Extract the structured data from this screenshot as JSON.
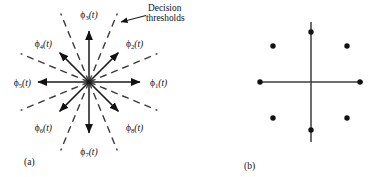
{
  "figure": {
    "panels": [
      {
        "id": "a",
        "caption": "(a)",
        "caption_x": 28,
        "caption_y": 162,
        "type": "signal-space-diagram",
        "center": {
          "x": 89,
          "y": 82
        },
        "annotation": {
          "line1": "Decision",
          "line2": "thresholds",
          "x": 128,
          "y": 12
        },
        "basis_functions": [
          {
            "name": "phi-1",
            "symbol": "ϕ",
            "subscript": "1",
            "arg": "(t)",
            "angle_deg": 0,
            "label_x": 150,
            "label_y": 85,
            "anchor": "start"
          },
          {
            "name": "phi-2",
            "symbol": "ϕ",
            "subscript": "2",
            "arg": "(t)",
            "angle_deg": 45,
            "label_x": 133,
            "label_y": 46,
            "anchor": "start"
          },
          {
            "name": "phi-3",
            "symbol": "ϕ",
            "subscript": "3",
            "arg": "(t)",
            "angle_deg": 90,
            "label_x": 89,
            "label_y": 16,
            "anchor": "middle"
          },
          {
            "name": "phi-4",
            "symbol": "ϕ",
            "subscript": "4",
            "arg": "(t)",
            "angle_deg": 135,
            "label_x": 45,
            "label_y": 46,
            "anchor": "end"
          },
          {
            "name": "phi-5",
            "symbol": "ϕ",
            "subscript": "5",
            "arg": "(t)",
            "angle_deg": 180,
            "label_x": 28,
            "label_y": 85,
            "anchor": "end"
          },
          {
            "name": "phi-6",
            "symbol": "ϕ",
            "subscript": "6",
            "arg": "(t)",
            "angle_deg": 225,
            "label_x": 45,
            "label_y": 130,
            "anchor": "end"
          },
          {
            "name": "phi-7",
            "symbol": "ϕ",
            "subscript": "7",
            "arg": "(t)",
            "angle_deg": 270,
            "label_x": 89,
            "label_y": 154,
            "anchor": "middle"
          },
          {
            "name": "phi-8",
            "symbol": "ϕ",
            "subscript": "8",
            "arg": "(t)",
            "angle_deg": 315,
            "label_x": 133,
            "label_y": 130,
            "anchor": "start"
          }
        ],
        "threshold_angles_deg": [
          22.5,
          67.5,
          112.5,
          157.5,
          202.5,
          247.5,
          292.5,
          337.5
        ],
        "axis_ray_length": 54,
        "diagonal_ray_length": 43,
        "threshold_length": 74
      },
      {
        "id": "b",
        "caption": "(b)",
        "caption_x": 248,
        "caption_y": 166,
        "type": "constellation",
        "center": {
          "x": 311,
          "y": 82
        },
        "axis_half_width": 52,
        "axis_half_height": 60,
        "points": [
          {
            "name": "point-1",
            "x": 360,
            "y": 82
          },
          {
            "name": "point-2",
            "x": 347,
            "y": 46
          },
          {
            "name": "point-3",
            "x": 311,
            "y": 32
          },
          {
            "name": "point-4",
            "x": 273,
            "y": 46
          },
          {
            "name": "point-5",
            "x": 260,
            "y": 82
          },
          {
            "name": "point-6",
            "x": 273,
            "y": 118
          },
          {
            "name": "point-7",
            "x": 311,
            "y": 130
          },
          {
            "name": "point-8",
            "x": 347,
            "y": 118
          }
        ],
        "dot_radius": 2.7
      }
    ],
    "colors": {
      "ink": "#111111",
      "threshold": "#3a3a3a",
      "background": "#ffffff"
    }
  }
}
